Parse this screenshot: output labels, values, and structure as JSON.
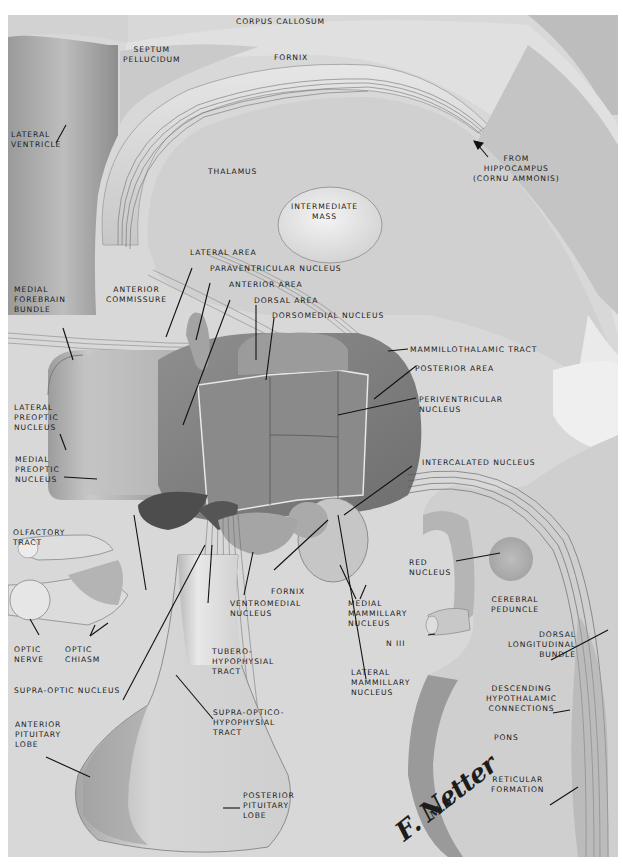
{
  "figure": {
    "type": "anatomical illustration",
    "colors": {
      "background": "#d9d9d9",
      "page": "#ffffff",
      "label_text": "#1a1a1a",
      "fiber_lines": "#555555"
    },
    "signature": {
      "name": "F. Netter",
      "suffix": "M.D."
    }
  },
  "labels": {
    "corpus_callosum": "CORPUS CALLOSUM",
    "septum_pellucidum": "SEPTUM\nPELLUCIDUM",
    "fornix_top": "FORNIX",
    "lateral_ventricle": "LATERAL\nVENTRICLE",
    "thalamus": "THALAMUS",
    "from_hippocampus": "FROM\nHIPPOCAMPUS\n(CORNU AMMONIS)",
    "intermediate_mass": "INTERMEDIATE\nMASS",
    "lateral_area": "LATERAL AREA",
    "paraventricular_nucleus": "PARAVENTRICULAR NUCLEUS",
    "anterior_area": "ANTERIOR AREA",
    "dorsal_area": "DORSAL AREA",
    "dorsomedial_nucleus": "DORSOMEDIAL NUCLEUS",
    "medial_forebrain_bundle": "MEDIAL\nFOREBRAIN\nBUNDLE",
    "anterior_commissure": "ANTERIOR\nCOMMISSURE",
    "mammillothalamic_tract": "MAMMILLOTHALAMIC TRACT",
    "posterior_area": "POSTERIOR AREA",
    "periventricular_nucleus": "PERIVENTRICULAR\nNUCLEUS",
    "lateral_preoptic_nucleus": "LATERAL\nPREOPTIC\nNUCLEUS",
    "medial_preoptic_nucleus": "MEDIAL\nPREOPTIC\nNUCLEUS",
    "intercalated_nucleus": "INTERCALATED NUCLEUS",
    "olfactory_tract": "OLFACTORY\nTRACT",
    "red_nucleus": "RED\nNUCLEUS",
    "cerebral_peduncle": "CEREBRAL\nPEDUNCLE",
    "fornix_bottom": "FORNIX",
    "ventromedial_nucleus": "VENTROMEDIAL\nNUCLEUS",
    "medial_mammillary_nucleus": "MEDIAL\nMAMMILLARY\nNUCLEUS",
    "n_iii": "N III",
    "optic_nerve": "OPTIC\nNERVE",
    "optic_chiasm": "OPTIC\nCHIASM",
    "tuberohypophysial_tract": "TUBERO-\nHYPOPHYSIAL\nTRACT",
    "dorsal_longitudinal_bundle": "DORSAL\nLONGITUDINAL\nBUNDLE",
    "lateral_mammillary_nucleus": "LATERAL\nMAMMILLARY\nNUCLEUS",
    "supra_optic_nucleus": "SUPRA-OPTIC NUCLEUS",
    "descending_hypothalamic_connections": "DESCENDING\nHYPOTHALAMIC\nCONNECTIONS",
    "supraopticohypophysial_tract": "SUPRA-OPTICO-\nHYPOPHYSIAL\nTRACT",
    "anterior_pituitary_lobe": "ANTERIOR\nPITUITARY\nLOBE",
    "pons": "PONS",
    "reticular_formation": "RETICULAR\nFORMATION",
    "posterior_pituitary_lobe": "POSTERIOR\nPITUITARY\nLOBE"
  }
}
